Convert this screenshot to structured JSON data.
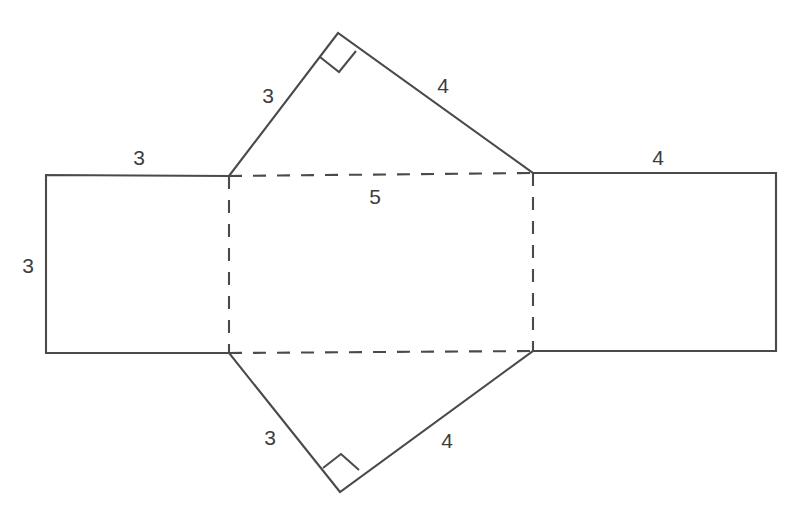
{
  "figure": {
    "kind": "geometry-net-diagram",
    "stroke_color": "#4a4a4a",
    "label_color": "#3d3d3d",
    "background_color": "#ffffff"
  },
  "labels": [
    {
      "id": "left-rect-top",
      "text": "3",
      "x": 139,
      "y": 157
    },
    {
      "id": "left-rect-side",
      "text": "3",
      "x": 28,
      "y": 265
    },
    {
      "id": "top-triangle-left-leg",
      "text": "3",
      "x": 268,
      "y": 95
    },
    {
      "id": "top-triangle-right-leg",
      "text": "4",
      "x": 443,
      "y": 85
    },
    {
      "id": "right-rect-top",
      "text": "4",
      "x": 658,
      "y": 157
    },
    {
      "id": "center-rect-hypotenuse",
      "text": "5",
      "x": 375,
      "y": 196
    },
    {
      "id": "bottom-triangle-left-leg",
      "text": "3",
      "x": 270,
      "y": 437
    },
    {
      "id": "bottom-triangle-right-leg",
      "text": "4",
      "x": 447,
      "y": 440
    }
  ],
  "geometry": {
    "left_rectangle": {
      "top_left": [
        46,
        175
      ],
      "top_right": [
        229,
        176
      ],
      "bottom_right": [
        229,
        353
      ],
      "bottom_left": [
        46,
        353
      ]
    },
    "center_rectangle": {
      "top_left": [
        229,
        176
      ],
      "top_right": [
        533,
        173
      ],
      "bottom_right": [
        533,
        351
      ],
      "bottom_left": [
        229,
        353
      ],
      "dashed": true
    },
    "right_rectangle": {
      "top_left": [
        533,
        173
      ],
      "top_right": [
        776,
        173
      ],
      "bottom_right": [
        776,
        351
      ],
      "bottom_left": [
        533,
        351
      ]
    },
    "top_triangle": {
      "left_base": [
        229,
        176
      ],
      "apex": [
        338,
        33
      ],
      "right_base": [
        533,
        173
      ],
      "right_angle_at": "apex"
    },
    "bottom_triangle": {
      "left_base": [
        229,
        353
      ],
      "apex": [
        340,
        492
      ],
      "right_base": [
        533,
        351
      ],
      "right_angle_at": "apex"
    }
  },
  "angle_markers": [
    {
      "id": "top-right-angle",
      "vertex": [
        338,
        33
      ]
    },
    {
      "id": "bottom-right-angle",
      "vertex": [
        340,
        492
      ]
    }
  ]
}
